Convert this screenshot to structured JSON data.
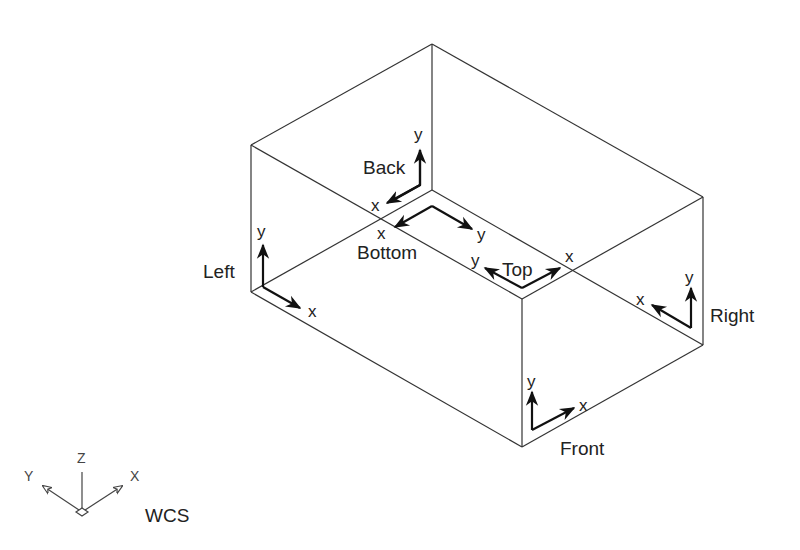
{
  "diagram": {
    "faces": {
      "back": {
        "label": "Back",
        "x_axis": "x",
        "y_axis": "y"
      },
      "bottom": {
        "label": "Bottom",
        "x_axis": "x",
        "y_axis": "y"
      },
      "top": {
        "label": "Top",
        "x_axis": "x",
        "y_axis": "y"
      },
      "left": {
        "label": "Left",
        "x_axis": "x",
        "y_axis": "y"
      },
      "right": {
        "label": "Right",
        "x_axis": "x",
        "y_axis": "y"
      },
      "front": {
        "label": "Front",
        "x_axis": "x",
        "y_axis": "y"
      }
    },
    "wcs_icon": {
      "label": "WCS",
      "x": "X",
      "y": "Y",
      "z": "Z"
    }
  },
  "colors": {
    "line": "#333333",
    "arrow": "#111111",
    "background": "#ffffff"
  }
}
